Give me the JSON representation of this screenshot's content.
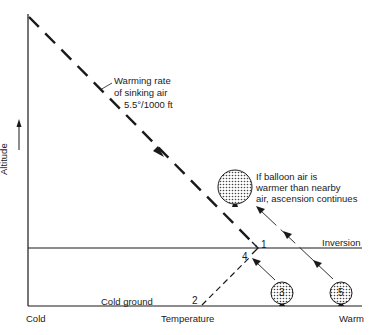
{
  "diagram": {
    "type": "temperature-altitude inversion diagram",
    "axes": {
      "y_label": "Altitude",
      "x_label": "Temperature",
      "x_min_label": "Cold",
      "x_max_label": "Warm"
    },
    "lines": {
      "sinking_air_label": [
        "Warming rate",
        "of sinking air",
        "5.5°/1000 ft"
      ],
      "inversion_label": "Inversion",
      "ground_label": "Cold ground"
    },
    "points": {
      "p1": "1",
      "p2": "2",
      "p4": "4"
    },
    "balloons": {
      "b3": "3",
      "b5": "5",
      "top_note": [
        "If balloon air is",
        "warmer than nearby",
        "air, ascension continues"
      ]
    },
    "colors": {
      "ink": "#1a1a1a",
      "background": "#ffffff"
    }
  }
}
